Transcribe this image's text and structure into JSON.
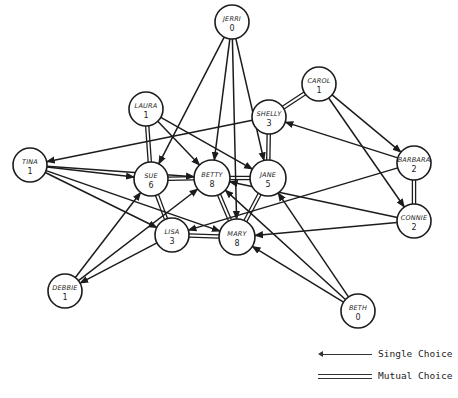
{
  "diagram": {
    "type": "sociogram",
    "nodes": [
      {
        "id": "jerri",
        "name": "JERRI",
        "count": "0",
        "x": 232,
        "y": 22,
        "r": 17
      },
      {
        "id": "carol",
        "name": "CAROL",
        "count": "1",
        "x": 319,
        "y": 84,
        "r": 17
      },
      {
        "id": "laura",
        "name": "LAURA",
        "count": "1",
        "x": 146,
        "y": 109,
        "r": 17
      },
      {
        "id": "shelly",
        "name": "SHELLY",
        "count": "3",
        "x": 269,
        "y": 117,
        "r": 17
      },
      {
        "id": "tina",
        "name": "TINA",
        "count": "1",
        "x": 30,
        "y": 165,
        "r": 17
      },
      {
        "id": "sue",
        "name": "SUE",
        "count": "6",
        "x": 151,
        "y": 179,
        "r": 17
      },
      {
        "id": "betty",
        "name": "BETTY",
        "count": "8",
        "x": 212,
        "y": 178,
        "r": 18
      },
      {
        "id": "jane",
        "name": "JANE",
        "count": "5",
        "x": 268,
        "y": 178,
        "r": 18
      },
      {
        "id": "barbara",
        "name": "BARBARA",
        "count": "2",
        "x": 414,
        "y": 163,
        "r": 17
      },
      {
        "id": "connie",
        "name": "CONNIE",
        "count": "2",
        "x": 414,
        "y": 221,
        "r": 17
      },
      {
        "id": "lisa",
        "name": "LISA",
        "count": "3",
        "x": 172,
        "y": 235,
        "r": 17
      },
      {
        "id": "mary",
        "name": "MARY",
        "count": "8",
        "x": 237,
        "y": 237,
        "r": 18
      },
      {
        "id": "debbie",
        "name": "DEBBIE",
        "count": "1",
        "x": 65,
        "y": 291,
        "r": 17
      },
      {
        "id": "beth",
        "name": "BETH",
        "count": "0",
        "x": 358,
        "y": 311,
        "r": 17
      }
    ],
    "single_choices": [
      {
        "from": "jerri",
        "to": "sue"
      },
      {
        "from": "jerri",
        "to": "betty"
      },
      {
        "from": "jerri",
        "to": "mary"
      },
      {
        "from": "jerri",
        "to": "jane"
      },
      {
        "from": "laura",
        "to": "betty"
      },
      {
        "from": "laura",
        "to": "jane"
      },
      {
        "from": "carol",
        "to": "barbara"
      },
      {
        "from": "carol",
        "to": "connie"
      },
      {
        "from": "shelly",
        "to": "tina"
      },
      {
        "from": "barbara",
        "to": "shelly"
      },
      {
        "from": "barbara",
        "to": "lisa"
      },
      {
        "from": "connie",
        "to": "mary"
      },
      {
        "from": "connie",
        "to": "betty"
      },
      {
        "from": "tina",
        "to": "sue"
      },
      {
        "from": "tina",
        "to": "lisa"
      },
      {
        "from": "tina",
        "to": "mary"
      },
      {
        "from": "tina",
        "to": "betty"
      },
      {
        "from": "debbie",
        "to": "sue"
      },
      {
        "from": "debbie",
        "to": "betty"
      },
      {
        "from": "lisa",
        "to": "debbie"
      },
      {
        "from": "beth",
        "to": "mary"
      },
      {
        "from": "beth",
        "to": "jane"
      },
      {
        "from": "beth",
        "to": "betty"
      }
    ],
    "mutual_choices": [
      {
        "a": "laura",
        "b": "sue"
      },
      {
        "a": "carol",
        "b": "shelly"
      },
      {
        "a": "shelly",
        "b": "jane"
      },
      {
        "a": "sue",
        "b": "betty"
      },
      {
        "a": "betty",
        "b": "jane"
      },
      {
        "a": "sue",
        "b": "lisa"
      },
      {
        "a": "lisa",
        "b": "mary"
      },
      {
        "a": "betty",
        "b": "mary"
      },
      {
        "a": "jane",
        "b": "mary"
      },
      {
        "a": "barbara",
        "b": "connie"
      }
    ]
  },
  "legend": {
    "single_label": "Single Choice",
    "mutual_label": "Mutual Choice"
  }
}
